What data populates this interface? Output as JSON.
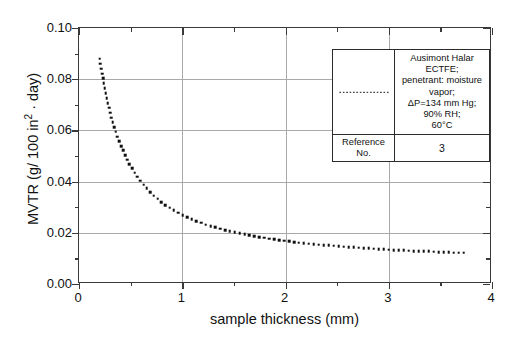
{
  "chart_data": {
    "type": "scatter",
    "title": "",
    "xlabel": "sample thickness (mm)",
    "ylabel": "MVTR (g / 100 in2 · day)",
    "ylabel_parts": {
      "prefix": "MVTR (g/ 100 in",
      "superscript": "2",
      "suffix": " · day)"
    },
    "xlim": [
      0,
      4
    ],
    "ylim": [
      0.0,
      0.1
    ],
    "xticks": [
      0,
      1,
      2,
      3,
      4
    ],
    "xtick_labels": [
      "0",
      "1",
      "2",
      "3",
      "4"
    ],
    "x_minor_step": 0.5,
    "yticks": [
      0.0,
      0.02,
      0.04,
      0.06,
      0.08,
      0.1
    ],
    "ytick_labels": [
      "0.00",
      "0.02",
      "0.04",
      "0.06",
      "0.08",
      "0.10"
    ],
    "y_minor_step": 0.01,
    "grid": true,
    "grid_color": "#a9a9a9",
    "series_color": "#101010",
    "legend_position": "top-right",
    "series": [
      {
        "name": "Ausimont Halar ECTFE",
        "style": "dotted",
        "x": [
          0.2,
          0.25,
          0.3,
          0.35,
          0.4,
          0.45,
          0.5,
          0.55,
          0.6,
          0.65,
          0.7,
          0.75,
          0.8,
          0.85,
          0.9,
          0.95,
          1.0,
          1.1,
          1.2,
          1.3,
          1.4,
          1.5,
          1.6,
          1.7,
          1.8,
          1.9,
          2.0,
          2.1,
          2.2,
          2.3,
          2.4,
          2.5,
          2.6,
          2.7,
          2.8,
          2.9,
          3.0,
          3.1,
          3.2,
          3.3,
          3.4,
          3.5,
          3.6,
          3.7,
          3.75
        ],
        "y": [
          0.088,
          0.076,
          0.067,
          0.06,
          0.0545,
          0.05,
          0.046,
          0.0428,
          0.04,
          0.0376,
          0.0354,
          0.0336,
          0.032,
          0.0305,
          0.0292,
          0.028,
          0.027,
          0.0251,
          0.0236,
          0.0223,
          0.0212,
          0.0202,
          0.0194,
          0.0186,
          0.018,
          0.0174,
          0.0168,
          0.0163,
          0.0159,
          0.0155,
          0.0151,
          0.0148,
          0.0145,
          0.0142,
          0.0139,
          0.0137,
          0.0134,
          0.0132,
          0.013,
          0.0128,
          0.0127,
          0.0125,
          0.0123,
          0.0122,
          0.0121
        ]
      }
    ]
  },
  "legend": {
    "series_description": "Ausimont Halar ECTFE; penetrant: moisture vapor; ΔP=134 mm Hg; 90% RH; 60°C",
    "series_description_lines": [
      "Ausimont Halar ECTFE;",
      "penetrant: moisture vapor;",
      "ΔP=134 mm Hg; 90% RH;",
      "60°C"
    ],
    "reference_label": "Reference No.",
    "reference_value": "3",
    "swatch_style": "dotted-line"
  }
}
